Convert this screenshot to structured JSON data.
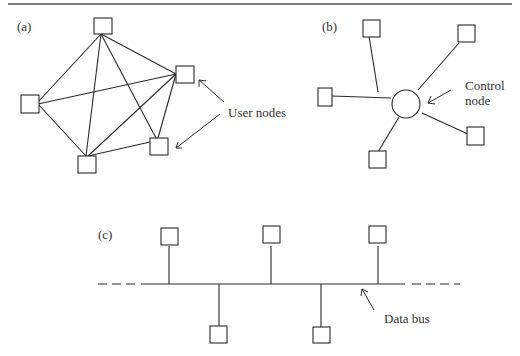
{
  "figure": {
    "panel_a": {
      "label": "(a)",
      "title": "Fully connected (mesh) network",
      "annotation": "User nodes"
    },
    "panel_b": {
      "label": "(b)",
      "title": "Star network",
      "annotation_line1": "Control",
      "annotation_line2": "node"
    },
    "panel_c": {
      "label": "(c)",
      "title": "Bus network",
      "annotation": "Data bus"
    }
  },
  "colors": {
    "stroke": "#2a2a2a",
    "background": "#ffffff",
    "text": "#333333"
  }
}
